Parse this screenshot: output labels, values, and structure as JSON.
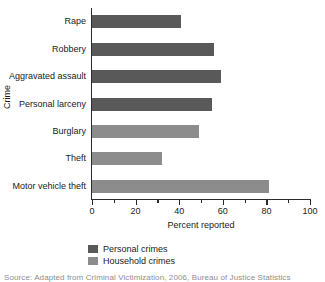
{
  "chart_data": {
    "type": "bar",
    "orientation": "horizontal",
    "title": "",
    "xlabel": "Percent reported",
    "ylabel": "Crime",
    "categories": [
      "Rape",
      "Robbery",
      "Aggravated assault",
      "Personal larceny",
      "Burglary",
      "Theft",
      "Motor vehicle theft"
    ],
    "values": [
      41,
      56,
      59,
      55,
      49,
      32,
      81
    ],
    "groups": [
      "Personal crimes",
      "Personal crimes",
      "Personal crimes",
      "Personal crimes",
      "Household crimes",
      "Household crimes",
      "Household crimes"
    ],
    "series": [
      {
        "name": "Personal crimes",
        "color": "#595959",
        "points": [
          {
            "category": "Rape",
            "value": 41
          },
          {
            "category": "Robbery",
            "value": 56
          },
          {
            "category": "Aggravated assault",
            "value": 59
          },
          {
            "category": "Personal larceny",
            "value": 55
          }
        ]
      },
      {
        "name": "Household crimes",
        "color": "#8c8c8c",
        "points": [
          {
            "category": "Burglary",
            "value": 49
          },
          {
            "category": "Theft",
            "value": 32
          },
          {
            "category": "Motor vehicle theft",
            "value": 81
          }
        ]
      }
    ],
    "xlim": [
      0,
      100
    ],
    "xticks": [
      0,
      20,
      40,
      60,
      80,
      100
    ],
    "xtick_labels": [
      "0",
      "20",
      "40",
      "60",
      "80",
      "100"
    ],
    "xminor_ticks": [
      10,
      30,
      50,
      70,
      90
    ],
    "grid": false,
    "legend_position": "bottom"
  },
  "axis": {
    "y_title": "Crime",
    "x_title": "Percent reported"
  },
  "legend": {
    "items": [
      {
        "label": "Personal crimes",
        "color": "#595959"
      },
      {
        "label": "Household crimes",
        "color": "#8c8c8c"
      }
    ]
  },
  "source": {
    "text": "Source:   Adapted from Criminal Victimization,  2006, Bureau of Justice Statistics"
  },
  "colors": {
    "personal": "#595959",
    "household": "#8c8c8c",
    "axis": "#2b2b2b",
    "text": "#1a1a1a",
    "background": "#ffffff"
  }
}
